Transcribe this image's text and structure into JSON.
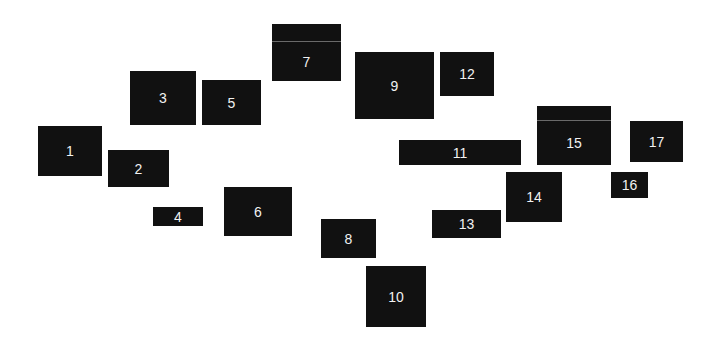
{
  "diagram": {
    "width": 715,
    "height": 342,
    "box_color": "#111111",
    "label_color": "#f2f2f2",
    "boxes": [
      {
        "id": "1",
        "label": "1",
        "x": 38,
        "y": 126,
        "w": 64,
        "h": 50
      },
      {
        "id": "2",
        "label": "2",
        "x": 108,
        "y": 150,
        "w": 61,
        "h": 37
      },
      {
        "id": "3",
        "label": "3",
        "x": 130,
        "y": 71,
        "w": 66,
        "h": 54
      },
      {
        "id": "4",
        "label": "4",
        "x": 153,
        "y": 207,
        "w": 50,
        "h": 19
      },
      {
        "id": "5",
        "label": "5",
        "x": 202,
        "y": 80,
        "w": 59,
        "h": 45
      },
      {
        "id": "6",
        "label": "6",
        "x": 224,
        "y": 187,
        "w": 68,
        "h": 49
      },
      {
        "id": "7",
        "label": "7",
        "x": 272,
        "y": 24,
        "w": 69,
        "h": 57,
        "divider_y": 17
      },
      {
        "id": "8",
        "label": "8",
        "x": 321,
        "y": 219,
        "w": 55,
        "h": 39
      },
      {
        "id": "9",
        "label": "9",
        "x": 355,
        "y": 52,
        "w": 79,
        "h": 67
      },
      {
        "id": "10",
        "label": "10",
        "x": 366,
        "y": 266,
        "w": 60,
        "h": 61
      },
      {
        "id": "11",
        "label": "11",
        "x": 399,
        "y": 140,
        "w": 122,
        "h": 25
      },
      {
        "id": "12",
        "label": "12",
        "x": 440,
        "y": 52,
        "w": 54,
        "h": 44
      },
      {
        "id": "13",
        "label": "13",
        "x": 432,
        "y": 210,
        "w": 69,
        "h": 28
      },
      {
        "id": "14",
        "label": "14",
        "x": 506,
        "y": 172,
        "w": 56,
        "h": 50
      },
      {
        "id": "15",
        "label": "15",
        "x": 537,
        "y": 106,
        "w": 74,
        "h": 59,
        "divider_y": 14
      },
      {
        "id": "16",
        "label": "16",
        "x": 611,
        "y": 172,
        "w": 37,
        "h": 26
      },
      {
        "id": "17",
        "label": "17",
        "x": 630,
        "y": 121,
        "w": 53,
        "h": 41
      }
    ]
  }
}
